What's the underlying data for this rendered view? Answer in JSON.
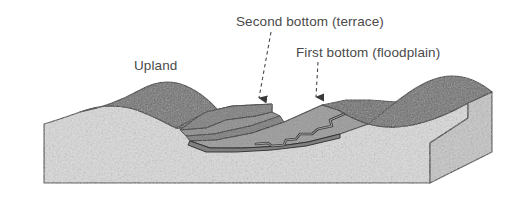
{
  "figure": {
    "type": "geomorphology-block-diagram",
    "background_color": "#ffffff"
  },
  "labels": [
    {
      "id": "upland",
      "text": "Upland",
      "x": 134,
      "y": 58,
      "has_leader": false
    },
    {
      "id": "second_bottom",
      "text": "Second bottom (terrace)",
      "x": 236,
      "y": 14,
      "has_leader": true
    },
    {
      "id": "first_bottom",
      "text": "First bottom (floodplain)",
      "x": 296,
      "y": 45,
      "has_leader": true
    }
  ],
  "leaders": [
    {
      "id": "leader-second-bottom",
      "style": "dashed",
      "from_x": 271,
      "from_y": 32,
      "to_x": 259,
      "to_y": 98,
      "arrowhead": "solid-triangle-down"
    },
    {
      "id": "leader-first-bottom",
      "style": "dashed",
      "from_x": 318,
      "from_y": 62,
      "to_x": 316,
      "to_y": 97,
      "arrowhead": "solid-triangle-down"
    }
  ],
  "colors": {
    "upland_surface": "#6e6e6e",
    "upland_surface_dark": "#5d5d5d",
    "terrace_tread": "#8b8b8b",
    "terrace_scarp": "#7c7c7c",
    "floodplain_surface": "#989898",
    "stream_channel": "#3c3c3c",
    "block_front_face": "#dadada",
    "block_side_face": "#c4c4c4",
    "outline": "#2b2b2b",
    "label_text": "#4a4a4a"
  },
  "surfaces": [
    {
      "id": "upland",
      "label": "Upland",
      "tone": "dark gray stipple"
    },
    {
      "id": "second_bottom",
      "label": "Second bottom (terrace)",
      "tone": "medium gray"
    },
    {
      "id": "first_bottom",
      "label": "First bottom (floodplain)",
      "tone": "medium-light gray"
    },
    {
      "id": "stream",
      "label": "Stream channel",
      "tone": "dark meander line"
    }
  ]
}
